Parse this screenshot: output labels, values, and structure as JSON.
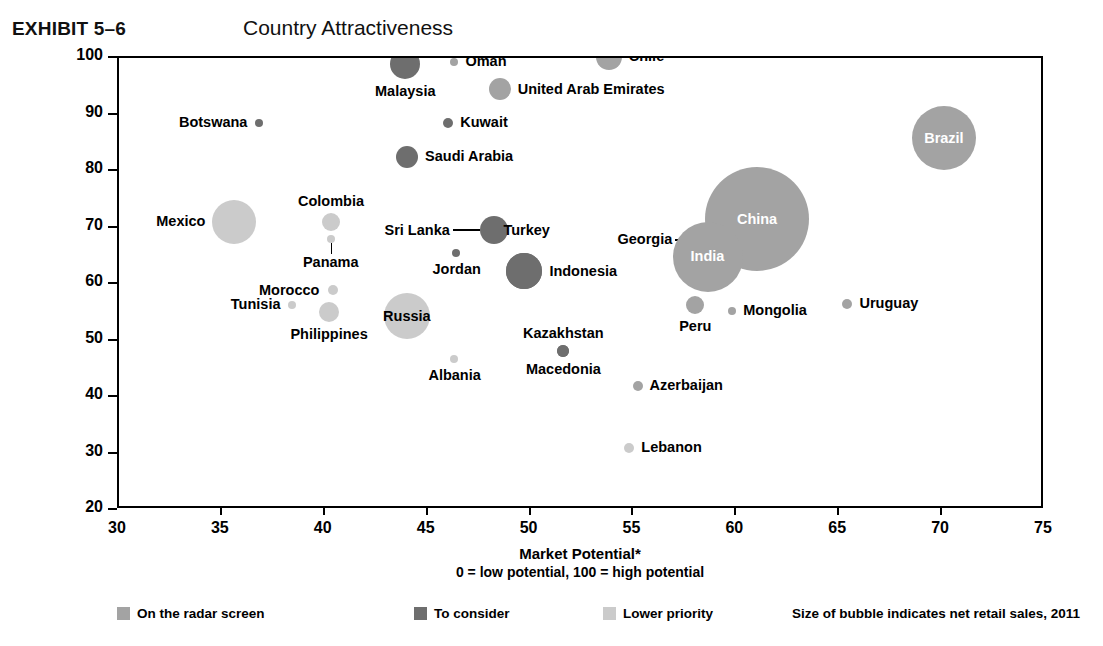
{
  "header": {
    "exhibit_label": "EXHIBIT 5–6",
    "title": "Country Attractiveness"
  },
  "axes": {
    "y_title_line1": "Country Risk (economic and political)",
    "y_title_line2": "0 = high risk, 100 = low risk",
    "x_title_line1": "Market Potential*",
    "x_title_line2": "0 = low potential, 100 = high potential",
    "y_ticks": [
      100,
      90,
      80,
      70,
      60,
      50,
      40,
      30,
      20
    ],
    "x_ticks": [
      30,
      35,
      40,
      45,
      50,
      55,
      60,
      65,
      70,
      75
    ]
  },
  "legend": {
    "items": [
      {
        "label": "On the radar screen",
        "color": "#a3a3a3"
      },
      {
        "label": "To consider",
        "color": "#6e6e6e"
      },
      {
        "label": "Lower priority",
        "color": "#cbcbcb"
      }
    ],
    "note": "Size of bubble indicates net retail sales, 2011"
  },
  "colors": {
    "radar": "#a3a3a3",
    "consider": "#6e6e6e",
    "lower": "#cbcbcb",
    "axis": "#000000"
  },
  "chart_data": {
    "type": "scatter",
    "title": "Country Attractiveness",
    "xlabel": "Market Potential*",
    "ylabel": "Country Risk (economic and political)",
    "xlim": [
      30,
      75
    ],
    "ylim": [
      20,
      100
    ],
    "grid": false,
    "legend_position": "bottom",
    "size_meaning": "Size of bubble indicates net retail sales, 2011",
    "categories": [
      "On the radar screen",
      "To consider",
      "Lower priority"
    ],
    "points": [
      {
        "name": "Malaysia",
        "x": 43.9,
        "y": 99.0,
        "r": 15,
        "cat": "consider",
        "label_pos": "below"
      },
      {
        "name": "Oman",
        "x": 46.3,
        "y": 99.3,
        "r": 4,
        "cat": "radar",
        "label_pos": "right"
      },
      {
        "name": "Chile",
        "x": 53.8,
        "y": 100.2,
        "r": 13,
        "cat": "radar",
        "label_pos": "right"
      },
      {
        "name": "United Arab Emirates",
        "x": 48.5,
        "y": 94.5,
        "r": 11,
        "cat": "radar",
        "label_pos": "right"
      },
      {
        "name": "Botswana",
        "x": 36.8,
        "y": 88.5,
        "r": 4,
        "cat": "consider",
        "label_pos": "left"
      },
      {
        "name": "Kuwait",
        "x": 46.0,
        "y": 88.5,
        "r": 5,
        "cat": "consider",
        "label_pos": "right"
      },
      {
        "name": "Brazil",
        "x": 70.1,
        "y": 85.8,
        "r": 32,
        "cat": "radar",
        "label_pos": "inside"
      },
      {
        "name": "Saudi Arabia",
        "x": 44.0,
        "y": 82.5,
        "r": 11,
        "cat": "consider",
        "label_pos": "right"
      },
      {
        "name": "China",
        "x": 61.0,
        "y": 71.5,
        "r": 52,
        "cat": "radar",
        "label_pos": "inside"
      },
      {
        "name": "Mexico",
        "x": 35.6,
        "y": 71.0,
        "r": 22,
        "cat": "lower",
        "label_pos": "left"
      },
      {
        "name": "Colombia",
        "x": 40.3,
        "y": 71.0,
        "r": 9,
        "cat": "lower",
        "label_pos": "above"
      },
      {
        "name": "Sri Lanka",
        "x": 48.2,
        "y": 69.5,
        "r": 14,
        "cat": "consider",
        "label_pos": "leader-left"
      },
      {
        "name": "Turkey",
        "x": 49.7,
        "y": 62.3,
        "r": 18,
        "cat": "consider",
        "label_pos": "above-far"
      },
      {
        "name": "Georgia",
        "x": 58.5,
        "y": 67.8,
        "r": 3,
        "cat": "radar",
        "label_pos": "leader-left"
      },
      {
        "name": "India",
        "x": 58.6,
        "y": 64.8,
        "r": 35,
        "cat": "radar",
        "label_pos": "inside"
      },
      {
        "name": "Panama",
        "x": 40.3,
        "y": 68.0,
        "r": 4,
        "cat": "lower",
        "label_pos": "below-leader"
      },
      {
        "name": "Jordan",
        "x": 46.4,
        "y": 65.5,
        "r": 4,
        "cat": "consider",
        "label_pos": "below"
      },
      {
        "name": "Indonesia",
        "x": 49.7,
        "y": 62.3,
        "r": 18,
        "cat": "consider",
        "label_pos": "right"
      },
      {
        "name": "Morocco",
        "x": 40.4,
        "y": 59.0,
        "r": 5,
        "cat": "lower",
        "label_pos": "left-far"
      },
      {
        "name": "Russia",
        "x": 44.0,
        "y": 54.3,
        "r": 23,
        "cat": "lower",
        "label_pos": "inside-dark"
      },
      {
        "name": "Tunisia",
        "x": 38.4,
        "y": 56.3,
        "r": 4,
        "cat": "lower",
        "label_pos": "left"
      },
      {
        "name": "Philippines",
        "x": 40.2,
        "y": 55.0,
        "r": 10,
        "cat": "lower",
        "label_pos": "below"
      },
      {
        "name": "Peru",
        "x": 58.0,
        "y": 56.3,
        "r": 9,
        "cat": "radar",
        "label_pos": "below"
      },
      {
        "name": "Mongolia",
        "x": 59.8,
        "y": 55.3,
        "r": 4,
        "cat": "radar",
        "label_pos": "right"
      },
      {
        "name": "Uruguay",
        "x": 65.4,
        "y": 56.5,
        "r": 5,
        "cat": "radar",
        "label_pos": "right"
      },
      {
        "name": "Kazakhstan",
        "x": 51.6,
        "y": 48.2,
        "r": 6,
        "cat": "consider",
        "label_pos": "above"
      },
      {
        "name": "Albania",
        "x": 46.3,
        "y": 46.8,
        "r": 4,
        "cat": "lower",
        "label_pos": "below"
      },
      {
        "name": "Macedonia",
        "x": 51.6,
        "y": 48.2,
        "r": 6,
        "cat": "consider",
        "label_pos": "below"
      },
      {
        "name": "Azerbaijan",
        "x": 55.2,
        "y": 42.0,
        "r": 5,
        "cat": "radar",
        "label_pos": "right"
      },
      {
        "name": "Lebanon",
        "x": 54.8,
        "y": 31.0,
        "r": 5,
        "cat": "lower",
        "label_pos": "right"
      }
    ]
  }
}
